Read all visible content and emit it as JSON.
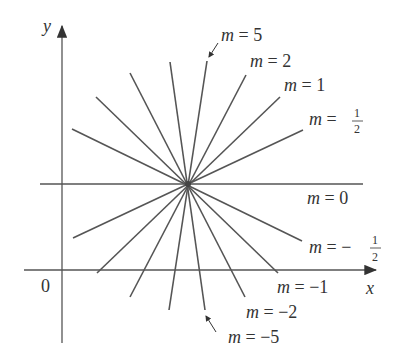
{
  "diagram": {
    "axes": {
      "x_label": "x",
      "y_label": "y",
      "origin_label": "0"
    },
    "center_point": {
      "x": 188,
      "y": 184
    },
    "lines": [
      {
        "slope_label": "5",
        "m": 5,
        "label_prefix": "m ="
      },
      {
        "slope_label": "2",
        "m": 2,
        "label_prefix": "m ="
      },
      {
        "slope_label": "1",
        "m": 1,
        "label_prefix": "m ="
      },
      {
        "slope_label": "1/2",
        "m": 0.5,
        "label_prefix": "m ="
      },
      {
        "slope_label": "0",
        "m": 0,
        "label_prefix": "m ="
      },
      {
        "slope_label": "−1/2",
        "m": -0.5,
        "label_prefix": "m ="
      },
      {
        "slope_label": "−1",
        "m": -1,
        "label_prefix": "m ="
      },
      {
        "slope_label": "−2",
        "m": -2,
        "label_prefix": "m ="
      },
      {
        "slope_label": "−5",
        "m": -5,
        "label_prefix": "m ="
      }
    ],
    "labels": {
      "m5": {
        "var": "m",
        "eq": " = 5"
      },
      "m2": {
        "var": "m",
        "eq": " = 2"
      },
      "m1": {
        "var": "m",
        "eq": " = 1"
      },
      "mhalf": {
        "var": "m",
        "eq": " = ",
        "num": "1",
        "den": "2"
      },
      "m0": {
        "var": "m",
        "eq": " = 0"
      },
      "mneghalf": {
        "var": "m",
        "eq": " = −",
        "num": "1",
        "den": "2"
      },
      "mneg1": {
        "var": "m",
        "eq": " = −1"
      },
      "mneg2": {
        "var": "m",
        "eq": " = −2"
      },
      "mneg5": {
        "var": "m",
        "eq": " = −5"
      }
    },
    "colors": {
      "line": "#555555",
      "axis": "#444444",
      "text": "#333333"
    }
  }
}
